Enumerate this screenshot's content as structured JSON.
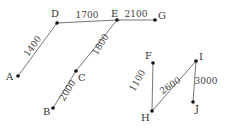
{
  "diagram": {
    "type": "weighted graph",
    "nodes": [
      {
        "id": "A",
        "label": "A",
        "x": 18,
        "y": 76,
        "lx": 6,
        "ly": 80
      },
      {
        "id": "D",
        "label": "D",
        "x": 57,
        "y": 23,
        "lx": 51,
        "ly": 17
      },
      {
        "id": "E",
        "label": "E",
        "x": 117,
        "y": 20,
        "lx": 111,
        "ly": 17
      },
      {
        "id": "G",
        "label": "G",
        "x": 155,
        "y": 20,
        "lx": 158,
        "ly": 19
      },
      {
        "id": "C",
        "label": "C",
        "x": 76,
        "y": 71,
        "lx": 78,
        "ly": 81
      },
      {
        "id": "B",
        "label": "B",
        "x": 53,
        "y": 108,
        "lx": 43,
        "ly": 115
      },
      {
        "id": "F",
        "label": "F",
        "x": 153,
        "y": 63,
        "lx": 145,
        "ly": 59
      },
      {
        "id": "I",
        "label": "I",
        "x": 196,
        "y": 61,
        "lx": 199,
        "ly": 60
      },
      {
        "id": "J",
        "label": "J",
        "x": 193,
        "y": 102,
        "lx": 195,
        "ly": 112
      },
      {
        "id": "H",
        "label": "H",
        "x": 152,
        "y": 111,
        "lx": 141,
        "ly": 121
      }
    ],
    "edges": [
      {
        "from": "A",
        "to": "D",
        "weight": "1400",
        "tx": 35,
        "ty": 48,
        "rot": -54
      },
      {
        "from": "D",
        "to": "E",
        "weight": "1700",
        "tx": 87,
        "ty": 18,
        "rot": 0
      },
      {
        "from": "E",
        "to": "G",
        "weight": "2100",
        "tx": 136,
        "ty": 17,
        "rot": 0
      },
      {
        "from": "E",
        "to": "C",
        "weight": "1800",
        "tx": 103,
        "ty": 46,
        "rot": -58
      },
      {
        "from": "C",
        "to": "B",
        "weight": "2000",
        "tx": 70,
        "ty": 92,
        "rot": -58
      },
      {
        "from": "H",
        "to": "F",
        "weight": "1100",
        "tx": 140,
        "ty": 82,
        "rot": -60
      },
      {
        "from": "H",
        "to": "I",
        "weight": "2600",
        "tx": 172,
        "ty": 88,
        "rot": -35
      },
      {
        "from": "I",
        "to": "J",
        "weight": "3000",
        "tx": 206,
        "ty": 84,
        "rot": 0
      }
    ]
  }
}
